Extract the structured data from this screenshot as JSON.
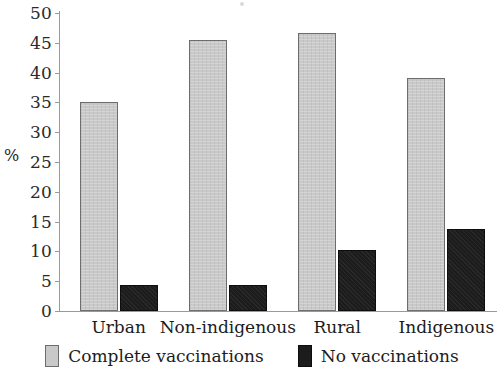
{
  "chart_data": {
    "type": "bar",
    "title": "",
    "subtitle": "",
    "xlabel": "",
    "ylabel": "%",
    "ylim": [
      0,
      50
    ],
    "ytick_step": 5,
    "yticks": [
      "50",
      "45",
      "40",
      "35",
      "30",
      "25",
      "20",
      "15",
      "10",
      "5",
      "0"
    ],
    "grid": false,
    "legend_position": "bottom-center",
    "categories": [
      "Urban",
      "Non-indigenous",
      "Rural",
      "Indigenous"
    ],
    "series": [
      {
        "name": "Complete vaccinations",
        "color": "#c9c9c9",
        "values": [
          35.0,
          45.4,
          46.6,
          39.1
        ]
      },
      {
        "name": "No vaccinations",
        "color": "#1c1c1c",
        "values": [
          4.4,
          4.4,
          10.2,
          13.8
        ]
      }
    ]
  },
  "axis": {
    "y_label": "%"
  },
  "legend": {
    "items": [
      {
        "label": "Complete vaccinations",
        "swatch": "legend-swatch-complete"
      },
      {
        "label": "No vaccinations",
        "swatch": "legend-swatch-none"
      }
    ]
  }
}
